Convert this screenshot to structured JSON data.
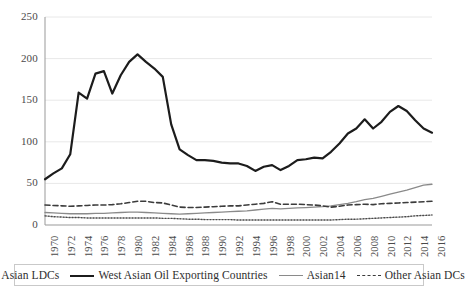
{
  "chart_data": {
    "type": "line",
    "title": "",
    "xlabel": "",
    "ylabel": "",
    "ylim": [
      0,
      250
    ],
    "yticks": [
      0,
      50,
      100,
      150,
      200,
      250
    ],
    "xlim": [
      1970,
      2016
    ],
    "xticks": [
      1970,
      1972,
      1974,
      1976,
      1978,
      1980,
      1982,
      1984,
      1986,
      1988,
      1990,
      1992,
      1994,
      1996,
      1998,
      2000,
      2002,
      2004,
      2006,
      2008,
      2010,
      2012,
      2014,
      2016
    ],
    "grid": "horizontal",
    "legend_position": "bottom",
    "x": [
      1970,
      1971,
      1972,
      1973,
      1974,
      1975,
      1976,
      1977,
      1978,
      1979,
      1980,
      1981,
      1982,
      1983,
      1984,
      1985,
      1986,
      1987,
      1988,
      1989,
      1990,
      1991,
      1992,
      1993,
      1994,
      1995,
      1996,
      1997,
      1998,
      1999,
      2000,
      2001,
      2002,
      2003,
      2004,
      2005,
      2006,
      2007,
      2008,
      2009,
      2010,
      2011,
      2012,
      2013,
      2014,
      2015,
      2016
    ],
    "series": [
      {
        "name": "Asian LDCs",
        "style": "dotted",
        "color": "#4a4a4a",
        "values": [
          11,
          10,
          9.5,
          9,
          9,
          8.5,
          8.5,
          8.5,
          8.5,
          8.5,
          8.5,
          8.5,
          8.5,
          8.5,
          8,
          8,
          7.5,
          7,
          7,
          6.5,
          6.5,
          6.5,
          6.5,
          6,
          6,
          6,
          6,
          6,
          6,
          6,
          6,
          6,
          6,
          6,
          6,
          6.5,
          7,
          7,
          7.5,
          8,
          8.5,
          9,
          9.5,
          10,
          11,
          11.5,
          12
        ]
      },
      {
        "name": "West Asian Oil Exporting Countries",
        "style": "thick-solid",
        "color": "#1c1c1c",
        "values": [
          55,
          62,
          68,
          85,
          159,
          152,
          182,
          185,
          158,
          180,
          196,
          205,
          196,
          188,
          178,
          121,
          91,
          84,
          78,
          78,
          77,
          75,
          74,
          74,
          71,
          65,
          70,
          72,
          66,
          71,
          78,
          79,
          81,
          80,
          88,
          98,
          110,
          116,
          127,
          116,
          124,
          136,
          143,
          137,
          126,
          116,
          111
        ]
      },
      {
        "name": "Asian14",
        "style": "thin-solid",
        "color": "#8a8a8a",
        "values": [
          15,
          14.5,
          14,
          13.5,
          13.5,
          13.5,
          14,
          14,
          14.5,
          15,
          15.5,
          15.5,
          15,
          14.5,
          14,
          13.5,
          13,
          13.5,
          14,
          14.5,
          15,
          15.5,
          16,
          16.5,
          17,
          18,
          19,
          20,
          19.5,
          20,
          20.5,
          21,
          21.5,
          22,
          23,
          24.5,
          26,
          28,
          30.5,
          32,
          34.5,
          37,
          39.5,
          42,
          45,
          48,
          49
        ]
      },
      {
        "name": "Other Asian DCs",
        "style": "dashed",
        "color": "#3c3c3c",
        "values": [
          24,
          23.5,
          23,
          22.5,
          23,
          23.5,
          24,
          24,
          24.5,
          25.5,
          27,
          28.5,
          28.5,
          27,
          26.5,
          24,
          21.5,
          21,
          21,
          21.5,
          22,
          22.5,
          23,
          23,
          24,
          25,
          26,
          28,
          25,
          25,
          25,
          24.5,
          24,
          23,
          21.5,
          22.5,
          24,
          24.5,
          25,
          24.5,
          25.5,
          26,
          26.5,
          27,
          27.5,
          28,
          28.5
        ]
      }
    ]
  },
  "axis": {
    "ytick_labels": [
      "250",
      "200",
      "150",
      "100",
      "50",
      "0"
    ],
    "xtick_labels": [
      "1970",
      "1972",
      "1974",
      "1976",
      "1978",
      "1980",
      "1982",
      "1984",
      "1986",
      "1988",
      "1990",
      "1992",
      "1994",
      "1996",
      "1998",
      "2000",
      "2002",
      "2004",
      "2006",
      "2008",
      "2010",
      "2012",
      "2014",
      "2016"
    ]
  },
  "legend": {
    "items": [
      {
        "label": "Asian LDCs",
        "style": "dotted"
      },
      {
        "label": "West Asian Oil Exporting Countries",
        "style": "thick-solid"
      },
      {
        "label": "Asian14",
        "style": "thin-solid"
      },
      {
        "label": "Other Asian DCs",
        "style": "dashed"
      }
    ]
  },
  "colors": {
    "gridline": "#e8e8e8",
    "axis": "#999999",
    "text": "#4a4a4a",
    "thick_line": "#1c1c1c",
    "thin_line": "#8a8a8a",
    "dashed_line": "#3c3c3c",
    "dotted_line": "#4a4a4a"
  }
}
